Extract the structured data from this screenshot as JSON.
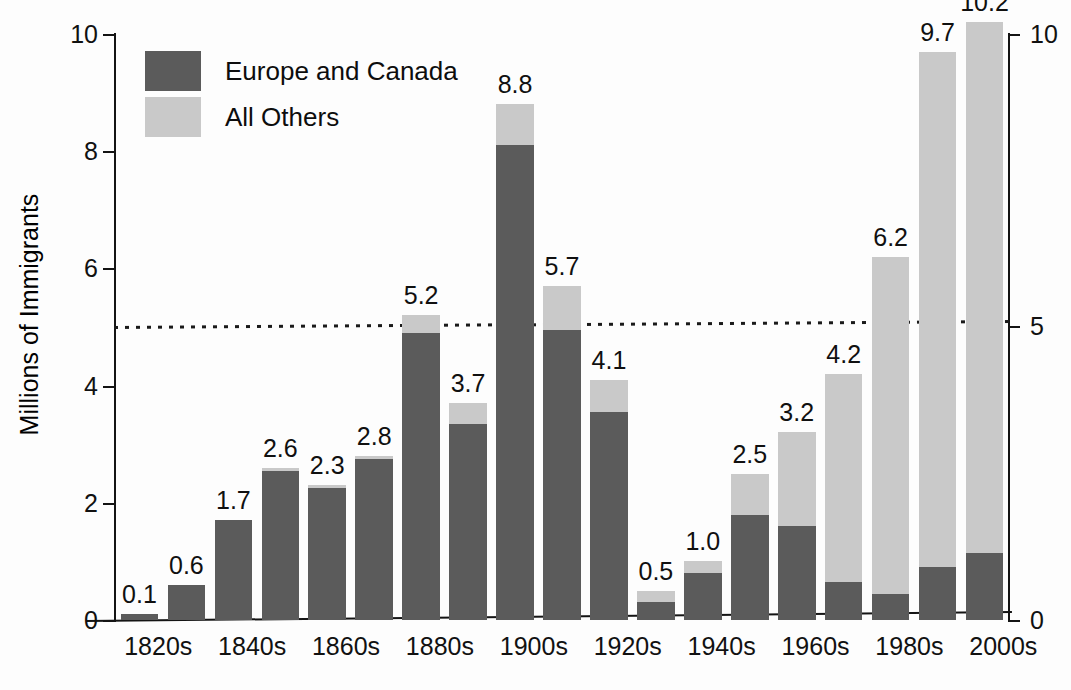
{
  "chart_data": {
    "type": "bar",
    "subtype": "stacked-bar",
    "title": "",
    "xlabel": "",
    "ylabel": "Millions of Immigrants",
    "ylim": [
      0,
      10
    ],
    "yticks": [
      "0",
      "2",
      "4",
      "6",
      "8",
      "10"
    ],
    "y_axis_right": {
      "ylim": [
        0,
        10
      ],
      "yticks": [
        "0",
        "5",
        "10"
      ]
    },
    "grid": false,
    "legend_position": "top-left",
    "reference_line": {
      "value": 5,
      "style": "dotted",
      "label": ""
    },
    "categories": [
      "1820s",
      "1830s",
      "1840s",
      "1850s",
      "1860s",
      "1870s",
      "1880s",
      "1890s",
      "1900s",
      "1910s",
      "1920s",
      "1930s",
      "1940s",
      "1950s",
      "1960s",
      "1970s",
      "1980s",
      "1990s",
      "2000s"
    ],
    "tick_labels_shown": [
      "1820s",
      "1840s",
      "1860s",
      "1880s",
      "1900s",
      "1920s",
      "1940s",
      "1960s",
      "1980s",
      "2000s"
    ],
    "series": [
      {
        "name": "Europe and Canada",
        "color": "#5b5b5b",
        "values": [
          0.1,
          0.6,
          1.7,
          2.55,
          2.25,
          2.75,
          4.9,
          3.35,
          8.1,
          4.95,
          3.55,
          0.3,
          0.8,
          1.8,
          1.6,
          0.65,
          0.45,
          0.9,
          1.15
        ]
      },
      {
        "name": "All Others",
        "color": "#c9c9c9",
        "values": [
          0.0,
          0.0,
          0.0,
          0.05,
          0.05,
          0.05,
          0.3,
          0.35,
          0.7,
          0.75,
          0.55,
          0.2,
          0.2,
          0.7,
          1.6,
          3.55,
          5.75,
          8.8,
          9.05
        ]
      }
    ],
    "totals": [
      0.1,
      0.6,
      1.7,
      2.6,
      2.3,
      2.8,
      5.2,
      3.7,
      8.8,
      5.7,
      4.1,
      0.5,
      1.0,
      2.5,
      3.2,
      4.2,
      6.2,
      9.7,
      10.2
    ],
    "data_labels": [
      "0.1",
      "0.6",
      "1.7",
      "2.6",
      "2.3",
      "2.8",
      "5.2",
      "3.7",
      "8.8",
      "5.7",
      "4.1",
      "0.5",
      "1.0",
      "2.5",
      "3.2",
      "4.2",
      "6.2",
      "9.7",
      "10.2"
    ]
  },
  "legend": {
    "items": [
      {
        "label": "Europe and Canada",
        "color": "#5b5b5b"
      },
      {
        "label": "All Others",
        "color": "#c9c9c9"
      }
    ]
  },
  "axis": {
    "y_title": "Millions of Immigrants",
    "left_ticks": [
      "10",
      "8",
      "6",
      "4",
      "2",
      "0"
    ],
    "right_ticks": [
      "10",
      "5",
      "0"
    ]
  }
}
